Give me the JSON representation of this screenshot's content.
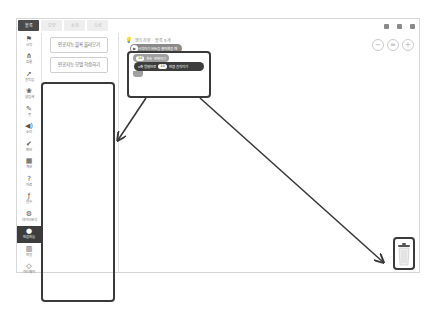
{
  "tabs": [
    {
      "label": "블록",
      "active": true
    },
    {
      "label": "모양",
      "active": false
    },
    {
      "label": "소리",
      "active": false
    },
    {
      "label": "속성",
      "active": false
    }
  ],
  "categories": [
    {
      "icon": "⚑",
      "label": "시작",
      "name": "start"
    },
    {
      "icon": "⋔",
      "label": "흐름",
      "name": "flow"
    },
    {
      "icon": "➚",
      "label": "움직임",
      "name": "motion"
    },
    {
      "icon": "❀",
      "label": "생김새",
      "name": "looks"
    },
    {
      "icon": "✎",
      "label": "붓",
      "name": "brush"
    },
    {
      "icon": "◀)",
      "label": "소리",
      "name": "sound"
    },
    {
      "icon": "✔",
      "label": "판단",
      "name": "judgement"
    },
    {
      "icon": "▦",
      "label": "계산",
      "name": "calculation"
    },
    {
      "icon": "?",
      "label": "자료",
      "name": "data"
    },
    {
      "icon": "ƒ",
      "label": "함수",
      "name": "function"
    },
    {
      "icon": "⚙",
      "label": "데이터분석",
      "name": "data-analysis"
    },
    {
      "icon": "●",
      "label": "인공지능",
      "name": "ai",
      "active": true
    },
    {
      "icon": "▥",
      "label": "확장",
      "name": "extension"
    },
    {
      "icon": "◇",
      "label": "하드웨어",
      "name": "hardware"
    }
  ],
  "palette": {
    "buttons": [
      {
        "label": "인공지능 블록 불러오기"
      },
      {
        "label": "인공지능 모델 학습하기"
      }
    ]
  },
  "canvas": {
    "object_label": "엔트리봇 · 블록 5개",
    "zoom_controls": [
      "−",
      "=",
      "+"
    ],
    "blocks": {
      "start": "시작하기 버튼을 클릭했을 때",
      "repeat": "계속 반복하기",
      "repeat_value": "10",
      "move_prefix": "x축 방향으로",
      "move_value": "10",
      "move_suffix": "만큼 움직이기"
    }
  },
  "annotation": {
    "color": "#3a3a3a"
  }
}
